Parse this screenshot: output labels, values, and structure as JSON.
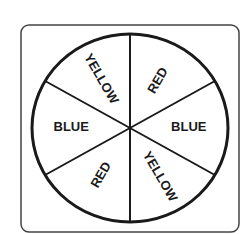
{
  "spinner": {
    "title": "Spinner",
    "sections": [
      {
        "label": "RED"
      },
      {
        "label": "BLUE"
      },
      {
        "label": "YELLOW"
      },
      {
        "label": "RED"
      },
      {
        "label": "BLUE"
      },
      {
        "label": "YELLOW"
      }
    ],
    "section_count": 6,
    "colors": {
      "stroke": "#1a1a1a",
      "background": "#ffffff",
      "box": "#333333"
    }
  }
}
